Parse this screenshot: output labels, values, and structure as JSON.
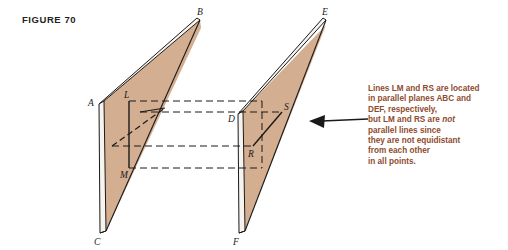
{
  "figure": {
    "title": "FIGURE 70",
    "title_color": "#231f20",
    "plane_fill": "#d4ae90",
    "plane_edge": "#1a1a1a",
    "band_fill": "#f7f3ee",
    "line_color": "#1a1a1a",
    "annotation_color": "#8e4b2e"
  },
  "labels": {
    "A": "A",
    "B": "B",
    "C": "C",
    "D": "D",
    "E": "E",
    "F": "F",
    "L": "L",
    "M": "M",
    "R": "R",
    "S": "S"
  },
  "annotation": {
    "line1": "Lines LM and RS are located",
    "line2": "in parallel planes ABC and",
    "line3": "DEF, respectively,",
    "line4a": "but LM and RS are ",
    "line4b": "not",
    "line5": "parallel lines since",
    "line6": "they are not equidistant",
    "line7": "from each other",
    "line8": "in all points."
  },
  "geometry": {
    "left_plane": {
      "name": "plane-ABC",
      "vertices": "A(99,103) B(200,19) C(100,232)",
      "segment": "LM",
      "segment_endpoints": "L(129,101) M(129,168)"
    },
    "right_plane": {
      "name": "plane-DEF",
      "vertices": "D(238,113) E(326,19) F(238,232)",
      "segment": "RS",
      "segment_endpoints": "R(253,146) S(282,112)"
    },
    "arrow": {
      "name": "callout-arrow",
      "from": "(368,120)",
      "to": "(310,121)"
    }
  }
}
